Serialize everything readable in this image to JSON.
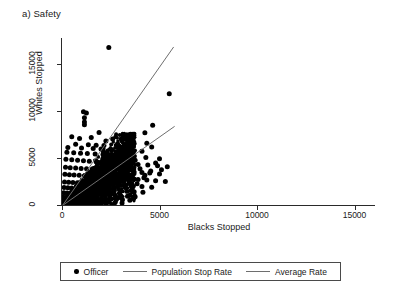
{
  "figure": {
    "panel_title": "a) Safety"
  },
  "chart_data": {
    "type": "scatter",
    "title": "a) Safety",
    "xlabel": "Blacks Stopped",
    "ylabel": "Whites Stopped",
    "xlim": [
      0,
      16000
    ],
    "ylim": [
      0,
      17500
    ],
    "xticks": [
      0,
      5000,
      10000,
      15000
    ],
    "yticks": [
      0,
      5000,
      10000,
      15000
    ],
    "xtick_labels": [
      "0",
      "5000",
      "10000",
      "15000"
    ],
    "ytick_labels": [
      "0",
      "5000",
      "10000",
      "15000"
    ],
    "grid": false,
    "legend_position": "below-axes",
    "legend": [
      {
        "label": "Officer",
        "marker": "filled-circle",
        "color": "#000000"
      },
      {
        "label": "Population Stop Rate",
        "marker": "line",
        "color": "#6e6e6e"
      },
      {
        "label": "Average Rate",
        "marker": "line",
        "color": "#6e6e6e"
      }
    ],
    "series": [
      {
        "name": "Officer",
        "type": "scatter",
        "marker": "filled-circle",
        "color": "#000000",
        "note": "dense cloud of officer observations concentrated near the origin with a right-skewed tail",
        "points": [
          [
            2400,
            16700
          ],
          [
            5500,
            11800
          ],
          [
            1100,
            9900
          ],
          [
            1250,
            9750
          ],
          [
            1150,
            9250
          ],
          [
            1150,
            8800
          ],
          [
            1150,
            8500
          ],
          [
            4650,
            8450
          ],
          [
            1900,
            7700
          ],
          [
            4250,
            7650
          ],
          [
            500,
            7250
          ],
          [
            1500,
            7150
          ],
          [
            900,
            7050
          ],
          [
            2600,
            7000
          ],
          [
            3100,
            6950
          ],
          [
            2250,
            6800
          ],
          [
            4350,
            6550
          ],
          [
            2850,
            6500
          ],
          [
            700,
            6450
          ],
          [
            1350,
            6400
          ],
          [
            1750,
            6350
          ],
          [
            2150,
            6300
          ],
          [
            3400,
            6250
          ],
          [
            4600,
            6150
          ],
          [
            300,
            6100
          ],
          [
            1000,
            6050
          ],
          [
            1600,
            6000
          ],
          [
            2000,
            5950
          ],
          [
            2500,
            5900
          ],
          [
            3000,
            5850
          ],
          [
            3600,
            5800
          ],
          [
            4100,
            5700
          ],
          [
            250,
            5600
          ],
          [
            600,
            5550
          ],
          [
            950,
            5500
          ],
          [
            1300,
            5450
          ],
          [
            1700,
            5400
          ],
          [
            2100,
            5350
          ],
          [
            2450,
            5300
          ],
          [
            2800,
            5250
          ],
          [
            3200,
            5200
          ],
          [
            3700,
            5150
          ],
          [
            4300,
            5050
          ],
          [
            5000,
            4900
          ],
          [
            200,
            4850
          ],
          [
            500,
            4800
          ],
          [
            800,
            4750
          ],
          [
            1100,
            4700
          ],
          [
            1400,
            4650
          ],
          [
            1750,
            4600
          ],
          [
            2050,
            4550
          ],
          [
            2350,
            4500
          ],
          [
            2700,
            4450
          ],
          [
            3050,
            4400
          ],
          [
            3450,
            4350
          ],
          [
            3900,
            4300
          ],
          [
            4400,
            4250
          ],
          [
            4900,
            4150
          ],
          [
            5400,
            4050
          ],
          [
            180,
            4000
          ],
          [
            420,
            3960
          ],
          [
            700,
            3920
          ],
          [
            980,
            3880
          ],
          [
            1260,
            3840
          ],
          [
            1540,
            3800
          ],
          [
            1820,
            3760
          ],
          [
            2100,
            3720
          ],
          [
            2400,
            3680
          ],
          [
            2700,
            3640
          ],
          [
            3000,
            3600
          ],
          [
            3350,
            3560
          ],
          [
            3700,
            3500
          ],
          [
            4100,
            3450
          ],
          [
            4500,
            3400
          ],
          [
            5000,
            3300
          ],
          [
            150,
            3250
          ],
          [
            380,
            3220
          ],
          [
            620,
            3180
          ],
          [
            880,
            3150
          ],
          [
            1150,
            3100
          ],
          [
            1420,
            3060
          ],
          [
            1700,
            3020
          ],
          [
            1980,
            2980
          ],
          [
            2260,
            2940
          ],
          [
            2550,
            2900
          ],
          [
            2850,
            2860
          ],
          [
            3150,
            2820
          ],
          [
            3500,
            2760
          ],
          [
            3900,
            2700
          ],
          [
            4350,
            2650
          ],
          [
            4800,
            2560
          ],
          [
            5300,
            2480
          ],
          [
            130,
            2450
          ],
          [
            340,
            2420
          ],
          [
            560,
            2390
          ],
          [
            790,
            2360
          ],
          [
            1030,
            2330
          ],
          [
            1280,
            2300
          ],
          [
            1540,
            2270
          ],
          [
            1800,
            2240
          ],
          [
            2060,
            2210
          ],
          [
            2320,
            2180
          ],
          [
            2600,
            2150
          ],
          [
            2900,
            2110
          ],
          [
            3250,
            2060
          ],
          [
            3650,
            2000
          ],
          [
            4100,
            1950
          ],
          [
            4600,
            1880
          ],
          [
            110,
            1850
          ],
          [
            300,
            1830
          ],
          [
            500,
            1800
          ],
          [
            710,
            1780
          ],
          [
            930,
            1750
          ],
          [
            1160,
            1720
          ],
          [
            1400,
            1700
          ],
          [
            1650,
            1670
          ],
          [
            1900,
            1640
          ],
          [
            2150,
            1610
          ],
          [
            2400,
            1580
          ],
          [
            2680,
            1550
          ],
          [
            2980,
            1510
          ],
          [
            3320,
            1460
          ],
          [
            3700,
            1400
          ],
          [
            4150,
            1340
          ],
          [
            90,
            1300
          ],
          [
            260,
            1280
          ],
          [
            440,
            1260
          ],
          [
            630,
            1240
          ],
          [
            830,
            1220
          ],
          [
            1040,
            1200
          ],
          [
            1260,
            1180
          ],
          [
            1490,
            1160
          ],
          [
            1720,
            1140
          ],
          [
            1960,
            1110
          ],
          [
            2200,
            1080
          ],
          [
            2450,
            1050
          ],
          [
            2720,
            1020
          ],
          [
            3020,
            980
          ],
          [
            3360,
            930
          ],
          [
            3750,
            870
          ],
          [
            75,
            820
          ],
          [
            220,
            800
          ],
          [
            380,
            790
          ],
          [
            550,
            775
          ],
          [
            730,
            760
          ],
          [
            920,
            745
          ],
          [
            1120,
            730
          ],
          [
            1330,
            715
          ],
          [
            1550,
            700
          ],
          [
            1780,
            680
          ],
          [
            2010,
            660
          ],
          [
            2250,
            640
          ],
          [
            2500,
            620
          ],
          [
            2780,
            590
          ],
          [
            3100,
            550
          ],
          [
            3480,
            500
          ],
          [
            60,
            460
          ],
          [
            180,
            450
          ],
          [
            310,
            440
          ],
          [
            450,
            430
          ],
          [
            600,
            420
          ],
          [
            760,
            410
          ],
          [
            930,
            400
          ],
          [
            1110,
            390
          ],
          [
            1300,
            375
          ],
          [
            1500,
            360
          ],
          [
            1710,
            345
          ],
          [
            1930,
            330
          ],
          [
            2160,
            310
          ],
          [
            2420,
            285
          ],
          [
            2720,
            250
          ],
          [
            3080,
            210
          ],
          [
            50,
            190
          ],
          [
            140,
            185
          ],
          [
            240,
            180
          ],
          [
            350,
            172
          ],
          [
            470,
            165
          ],
          [
            600,
            158
          ],
          [
            740,
            150
          ],
          [
            890,
            142
          ],
          [
            1050,
            134
          ],
          [
            1220,
            126
          ],
          [
            1400,
            118
          ],
          [
            1590,
            108
          ],
          [
            1790,
            96
          ],
          [
            2010,
            84
          ],
          [
            2260,
            68
          ],
          [
            2560,
            50
          ],
          [
            3300,
            3950
          ],
          [
            2900,
            4700
          ],
          [
            3300,
            5300
          ],
          [
            3750,
            4750
          ],
          [
            4000,
            3850
          ],
          [
            4250,
            3150
          ],
          [
            4550,
            3600
          ],
          [
            4800,
            4450
          ],
          [
            5100,
            3750
          ],
          [
            3850,
            2250
          ],
          [
            4200,
            2900
          ],
          [
            3600,
            1750
          ],
          [
            2950,
            1250
          ],
          [
            2450,
            870
          ],
          [
            1850,
            480
          ],
          [
            1350,
            250
          ]
        ]
      },
      {
        "name": "Population Stop Rate",
        "type": "line",
        "color": "#6e6e6e",
        "slope": 2.95,
        "intercept": 0,
        "endpoints": [
          [
            0,
            0
          ],
          [
            5700,
            16815
          ]
        ]
      },
      {
        "name": "Average Rate",
        "type": "line",
        "color": "#6e6e6e",
        "slope": 1.46,
        "intercept": 0,
        "endpoints": [
          [
            0,
            0
          ],
          [
            5750,
            8395
          ]
        ]
      }
    ]
  }
}
